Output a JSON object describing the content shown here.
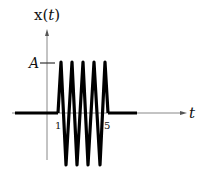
{
  "diagram": {
    "y_axis_label": "x(t)",
    "y_axis_label_func": "x(",
    "y_axis_label_var": "t",
    "y_axis_label_close": ")",
    "x_axis_label": "t",
    "amplitude_label": "A",
    "tick_labels": [
      "1",
      "5"
    ],
    "signal": {
      "description": "Sinusoidal burst of amplitude A between t=1 and t=5, zero elsewhere",
      "start_t": 1,
      "end_t": 5,
      "cycles": 5,
      "amplitude": "A"
    },
    "colors": {
      "signal": "#000000",
      "axes": "#777777",
      "text": "#111111"
    }
  }
}
